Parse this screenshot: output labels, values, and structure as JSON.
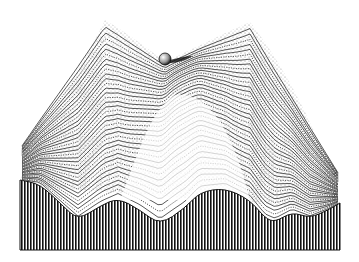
{
  "illustration": {
    "subject": "epigenetic landscape engraving",
    "style": "black ink stipple and hatching on white",
    "colors": {
      "ink": "#111111",
      "paper": "#ffffff"
    },
    "elements": {
      "ball": {
        "cx": 165,
        "cy": 59,
        "r": 6
      },
      "front_profile_points": [
        [
          20,
          180
        ],
        [
          40,
          184
        ],
        [
          62,
          205
        ],
        [
          78,
          220
        ],
        [
          100,
          206
        ],
        [
          118,
          198
        ],
        [
          140,
          210
        ],
        [
          160,
          225
        ],
        [
          185,
          208
        ],
        [
          200,
          192
        ],
        [
          225,
          188
        ],
        [
          250,
          200
        ],
        [
          265,
          218
        ],
        [
          275,
          222
        ],
        [
          292,
          212
        ],
        [
          310,
          218
        ],
        [
          328,
          210
        ],
        [
          340,
          203
        ]
      ],
      "front_bottom_y": 250,
      "ridge_peak": {
        "x": 175,
        "y": 95
      }
    }
  }
}
